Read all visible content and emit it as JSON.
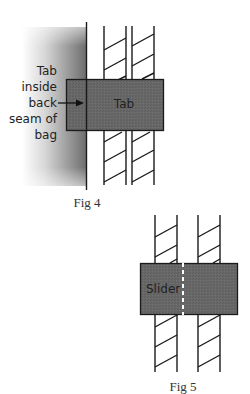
{
  "figures": [
    {
      "id": "fig4",
      "caption": "Fig 4",
      "tab_label": "Tab",
      "annotation_lines": [
        "Tab",
        "inside",
        "back",
        "seam of",
        "bag"
      ]
    },
    {
      "id": "fig5",
      "caption": "Fig 5",
      "slider_label": "Slider"
    }
  ],
  "colors": {
    "tab_fill": "#6b6b6b",
    "slider_fill": "#6b6b6b",
    "stroke": "#1a1a1a",
    "gradient_dark": "#6e6e6e",
    "gradient_light": "#ffffff"
  }
}
